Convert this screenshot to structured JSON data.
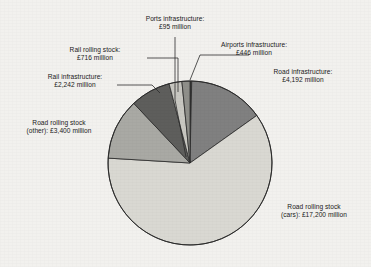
{
  "chart_data": {
    "type": "pie",
    "title": "",
    "subtitle": "",
    "xlabel": "",
    "ylabel": "",
    "units": "£ million",
    "total": 28291,
    "legend_position": "callout-labels",
    "grid": false,
    "start_angle_deg": 0,
    "direction": "clockwise",
    "categories": [
      "Ports infrastructure",
      "Road infrastructure",
      "Road rolling stock (cars)",
      "Road rolling stock (other)",
      "Rail infrastructure",
      "Rail rolling stock",
      "Airports infrastructure"
    ],
    "values": [
      95,
      4192,
      17200,
      3400,
      2242,
      716,
      446
    ],
    "slices": [
      {
        "name": "ports-infrastructure",
        "label_line1": "Ports infrastructure:",
        "label_line2": "£95 million",
        "value": 95,
        "value_text": "£95 million",
        "percent": "0.3%",
        "color": "#3a3a3a"
      },
      {
        "name": "road-infrastructure",
        "label_line1": "Road infrastructure:",
        "label_line2": "£4,192 million",
        "value": 4192,
        "value_text": "£4,192 million",
        "percent": "14.8%",
        "color": "#808080"
      },
      {
        "name": "road-rolling-stock-cars",
        "label_line1": "Road rolling stock",
        "label_line2": "(cars): £17,200 million",
        "value": 17200,
        "value_text": "£17,200 million",
        "percent": "60.8%",
        "color": "#d9d8d2"
      },
      {
        "name": "road-rolling-stock-other",
        "label_line1": "Road rolling stock",
        "label_line2": "(other): £3,400 million",
        "value": 3400,
        "value_text": "£3,400 million",
        "percent": "12.0%",
        "color": "#a9a9a4"
      },
      {
        "name": "rail-infrastructure",
        "label_line1": "Rail infrastructure:",
        "label_line2": "£2,242 million",
        "value": 2242,
        "value_text": "£2,242 million",
        "percent": "7.9%",
        "color": "#5e5e5c"
      },
      {
        "name": "rail-rolling-stock",
        "label_line1": "Rail rolling stock:",
        "label_line2": "£716 million",
        "value": 716,
        "value_text": "£716 million",
        "percent": "2.5%",
        "color": "#c8c7c1"
      },
      {
        "name": "airports-infrastructure",
        "label_line1": "Airports infrastructure:",
        "label_line2": "£446 million",
        "value": 446,
        "value_text": "£446 million",
        "percent": "1.6%",
        "color": "#8f8f8a"
      }
    ]
  },
  "labels": {
    "ports": "Ports infrastructure:\n£95 million",
    "airports": "Airports infrastructure:\n£446 million",
    "road_infra": "Road infrastructure:\n£4,192 million",
    "rail_rolling": "Rail rolling stock:\n£716 million",
    "rail_infra": "Rail infrastructure:\n£2,242 million",
    "road_other": "Road rolling stock\n(other): £3,400 million",
    "road_cars": "Road rolling stock\n(cars): £17,200 million"
  },
  "style": {
    "background": "#f2f1ee",
    "outline": "#2b2b2b",
    "text": "#1a1a1a"
  }
}
